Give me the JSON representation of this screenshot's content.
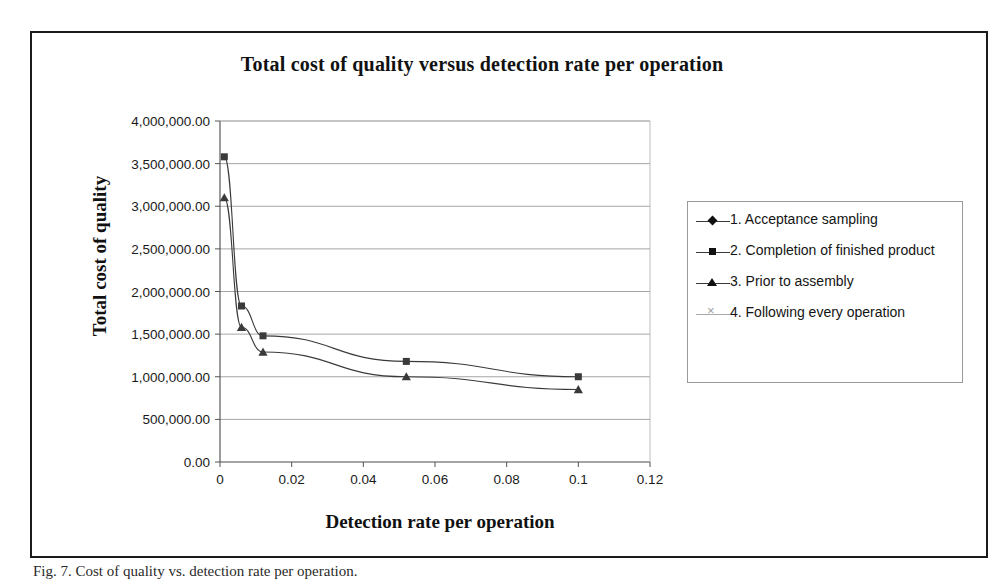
{
  "figure": {
    "caption": "Fig. 7. Cost of quality vs. detection rate per operation."
  },
  "chart_data": {
    "type": "line",
    "title": "Total cost of quality versus detection rate per operation",
    "xlabel": "Detection rate per operation",
    "ylabel": "Total cost of quality",
    "xlim": [
      0,
      0.12
    ],
    "ylim": [
      0,
      4000000
    ],
    "grid": true,
    "legend_position": "right",
    "xticks": [
      0,
      0.02,
      0.04,
      0.06,
      0.08,
      0.1,
      0.12
    ],
    "xtick_labels": [
      "0",
      "0.02",
      "0.04",
      "0.06",
      "0.08",
      "0.1",
      "0.12"
    ],
    "yticks": [
      0,
      500000,
      1000000,
      1500000,
      2000000,
      2500000,
      3000000,
      3500000,
      4000000
    ],
    "ytick_labels": [
      "0.00",
      "500,000.00",
      "1,000,000.00",
      "1,500,000.00",
      "2,000,000.00",
      "2,500,000.00",
      "3,000,000.00",
      "3,500,000.00",
      "4,000,000.00"
    ],
    "series": [
      {
        "name": "1. Acceptance sampling",
        "marker": "diamond",
        "color": "#3a3a3a",
        "x": [],
        "y": []
      },
      {
        "name": "2. Completion of finished product",
        "marker": "square",
        "color": "#3a3a3a",
        "x": [
          0.0012,
          0.006,
          0.012,
          0.052,
          0.1
        ],
        "y": [
          3580000,
          1830000,
          1480000,
          1180000,
          1000000
        ]
      },
      {
        "name": "3. Prior to assembly",
        "marker": "triangle",
        "color": "#3a3a3a",
        "x": [
          0.0012,
          0.006,
          0.012,
          0.052,
          0.1
        ],
        "y": [
          3100000,
          1580000,
          1290000,
          1000000,
          850000
        ]
      },
      {
        "name": "4. Following every operation",
        "marker": "cross",
        "color": "#a9a9a9",
        "x": [],
        "y": []
      }
    ]
  },
  "legend": {
    "items": [
      {
        "label": "1. Acceptance sampling",
        "marker": "diamond"
      },
      {
        "label": "2. Completion of finished product",
        "marker": "square"
      },
      {
        "label": "3. Prior to assembly",
        "marker": "triangle"
      },
      {
        "label": "4. Following every operation",
        "marker": "cross"
      }
    ]
  }
}
